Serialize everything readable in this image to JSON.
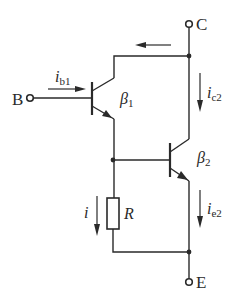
{
  "diagram": {
    "type": "circuit",
    "terminals": {
      "base": "B",
      "collector": "C",
      "emitter": "E"
    },
    "transistors": [
      {
        "id": "T1",
        "beta_symbol": "β",
        "beta_sub": "1"
      },
      {
        "id": "T2",
        "beta_symbol": "β",
        "beta_sub": "2"
      }
    ],
    "resistor": {
      "label": "R"
    },
    "currents": [
      {
        "id": "ib1",
        "symbol": "i",
        "sub": "b1",
        "direction": "right"
      },
      {
        "id": "ic2",
        "symbol": "i",
        "sub": "c2",
        "direction": "down"
      },
      {
        "id": "ie2",
        "symbol": "i",
        "sub": "e2",
        "direction": "down"
      },
      {
        "id": "i",
        "symbol": "i",
        "sub": "",
        "direction": "down"
      },
      {
        "id": "top",
        "symbol": "",
        "sub": "",
        "direction": "left"
      }
    ],
    "colors": {
      "ink": "#2a2a2a",
      "background": "#ffffff"
    }
  }
}
